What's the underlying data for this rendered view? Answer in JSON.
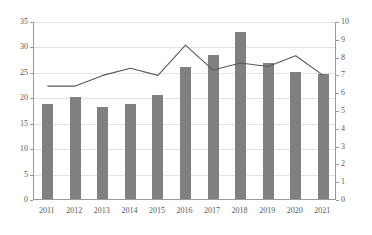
{
  "chart_data": {
    "type": "bar",
    "title": "",
    "subtitle": "",
    "xlabel": "",
    "ylabel": "",
    "categories": [
      "2011",
      "2012",
      "2013",
      "2014",
      "2015",
      "2016",
      "2017",
      "2018",
      "2019",
      "2020",
      "2021"
    ],
    "grid": true,
    "legend": "none",
    "axes": {
      "left": {
        "ylim": [
          0,
          35
        ],
        "ticks": [
          0,
          5,
          10,
          15,
          20,
          25,
          30,
          35
        ],
        "tick_labels": [
          "0",
          "5",
          "10",
          "15",
          "20",
          "25",
          "30",
          "35"
        ]
      },
      "right": {
        "ylim": [
          0,
          10
        ],
        "ticks": [
          0,
          1,
          2,
          3,
          4,
          5,
          6,
          7,
          8,
          9,
          10
        ],
        "tick_labels": [
          "0",
          "1",
          "2",
          "3",
          "4",
          "5",
          "6",
          "7",
          "8",
          "9",
          "10"
        ]
      }
    },
    "series": [
      {
        "name": "bars",
        "render": "bar",
        "axis": "left",
        "color": "#808080",
        "values": [
          18.7,
          20.1,
          18.0,
          18.6,
          20.4,
          25.9,
          28.4,
          32.9,
          26.7,
          25.0,
          24.6
        ]
      },
      {
        "name": "line",
        "render": "line",
        "axis": "right",
        "color": "#595959",
        "values": [
          6.4,
          6.4,
          7.0,
          7.4,
          7.0,
          8.7,
          7.3,
          7.7,
          7.5,
          8.1,
          7.0
        ]
      }
    ]
  },
  "colors": {
    "bar": "#808080",
    "line": "#595959",
    "grid": "#e3e3e3",
    "axis": "#9a9a9a",
    "tick_text": "#595959",
    "background": "#ffffff"
  }
}
